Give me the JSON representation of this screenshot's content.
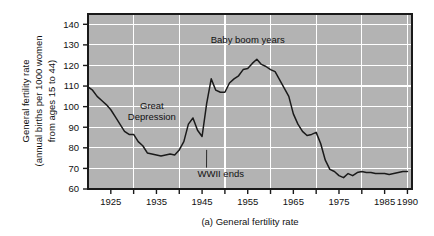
{
  "figure": {
    "caption_marker": "(a)",
    "caption_text": "General fertility rate",
    "caption_full": "(a)   General fertility rate"
  },
  "colors": {
    "plot_background": "#b3b3b3",
    "gridline": "#ffffff",
    "frame": "#1a1a1a",
    "data_line": "#1a1a1a",
    "text": "#111111",
    "page_background": "#ffffff"
  },
  "chart_data": {
    "type": "line",
    "title": "",
    "subtitle": "",
    "xlabel": "",
    "ylabel": "General fertility rate (annual births per 1000 women from ages 15 to 44)",
    "ylabel_lines": [
      "General fertility rate",
      "(annual births per 1000 women",
      "from ages 15 to 44)"
    ],
    "xlim": [
      1920,
      1991
    ],
    "ylim": [
      60,
      145
    ],
    "ytick_labels": [
      "60",
      "70",
      "80",
      "90",
      "100",
      "110",
      "120",
      "130",
      "140"
    ],
    "yticks": [
      60,
      70,
      80,
      90,
      100,
      110,
      120,
      130,
      140
    ],
    "xtick_labels": [
      "1925",
      "1935",
      "1945",
      "1955",
      "1965",
      "1975",
      "1985",
      "1990"
    ],
    "xticks": [
      1925,
      1935,
      1945,
      1955,
      1965,
      1975,
      1985,
      1990
    ],
    "xtick_minor": [
      1920,
      1930,
      1940,
      1950,
      1960,
      1970,
      1980,
      1990
    ],
    "grid": true,
    "grid_color": "#ffffff",
    "legend": null,
    "legend_position": "none",
    "annotations": [
      {
        "id": "great-depression",
        "text": "Great\nDepression",
        "line1": "Great",
        "line2": "Depression",
        "x": 1934,
        "y": 99,
        "leader": false
      },
      {
        "id": "baby-boom",
        "text": "Baby boom years",
        "x": 1955,
        "y": 131,
        "leader": false
      },
      {
        "id": "wwii-ends",
        "text": "WWII ends",
        "x": 1944,
        "y": 66,
        "leader": true,
        "leader_to_x": 1946,
        "leader_to_y": 79
      }
    ],
    "series": [
      {
        "name": "General fertility rate",
        "x": [
          1920,
          1921,
          1922,
          1923,
          1924,
          1925,
          1926,
          1927,
          1928,
          1929,
          1930,
          1931,
          1932,
          1933,
          1934,
          1935,
          1936,
          1937,
          1938,
          1939,
          1940,
          1941,
          1942,
          1943,
          1944,
          1945,
          1946,
          1947,
          1948,
          1949,
          1950,
          1951,
          1952,
          1953,
          1954,
          1955,
          1956,
          1957,
          1958,
          1959,
          1960,
          1961,
          1962,
          1963,
          1964,
          1965,
          1966,
          1967,
          1968,
          1969,
          1970,
          1971,
          1972,
          1973,
          1974,
          1975,
          1976,
          1977,
          1978,
          1979,
          1980,
          1981,
          1982,
          1983,
          1984,
          1985,
          1986,
          1987,
          1988,
          1989,
          1990
        ],
        "y": [
          109.6,
          108.0,
          105.0,
          103.0,
          101.0,
          98.5,
          95.0,
          91.5,
          88.0,
          86.5,
          86.5,
          83.0,
          81.0,
          77.5,
          77.0,
          76.5,
          76.0,
          76.5,
          77.0,
          76.5,
          79.0,
          83.0,
          91.5,
          94.5,
          88.5,
          85.5,
          101.5,
          113.5,
          108.0,
          107.0,
          107.0,
          111.5,
          113.5,
          115.0,
          118.0,
          118.5,
          121.0,
          123.0,
          120.5,
          119.5,
          118.0,
          117.0,
          113.0,
          109.0,
          105.0,
          96.5,
          91.5,
          88.0,
          86.0,
          86.5,
          87.5,
          82.0,
          74.0,
          69.5,
          68.5,
          66.5,
          65.5,
          67.5,
          66.5,
          68.0,
          68.5,
          68.0,
          68.0,
          67.5,
          67.5,
          67.5,
          67.0,
          67.5,
          68.0,
          68.5,
          68.5
        ]
      }
    ]
  }
}
